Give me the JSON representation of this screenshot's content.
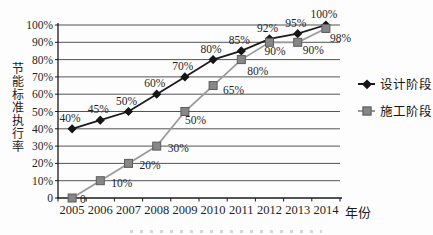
{
  "chart_data": {
    "type": "line",
    "title": "",
    "xlabel": "年份",
    "ylabel": "节能标准执行率",
    "x": [
      "2005",
      "2006",
      "2007",
      "2008",
      "2009",
      "2010",
      "2011",
      "2012",
      "2013",
      "2014"
    ],
    "ylim": [
      0,
      100
    ],
    "ytick_step": 10,
    "ytick_labels": [
      "0",
      "10%",
      "20%",
      "30%",
      "40%",
      "50%",
      "60%",
      "70%",
      "80%",
      "90%",
      "100%"
    ],
    "grid": true,
    "legend_position": "right",
    "series": [
      {
        "name": "设计阶段",
        "marker": "diamond",
        "line_color": "#1b1b1b",
        "marker_color": "#151515",
        "marker_border": "#151515",
        "values": [
          40,
          45,
          50,
          60,
          70,
          80,
          85,
          92,
          95,
          100
        ],
        "point_labels": [
          "40%",
          "45%",
          "50%",
          "60%",
          "70%",
          "80%",
          "85%",
          "92%",
          "95%",
          "100%"
        ]
      },
      {
        "name": "施工阶段",
        "marker": "square",
        "line_color": "#9b9b9b",
        "marker_color": "#878787",
        "marker_border": "#5c5c5c",
        "values": [
          0,
          10,
          20,
          30,
          50,
          65,
          80,
          90,
          90,
          98
        ],
        "point_labels": [
          "0",
          "10%",
          "20%",
          "30%",
          "50%",
          "65%",
          "80%",
          "90%",
          "90%",
          "98%"
        ]
      }
    ],
    "colors": {
      "grid": "#3f3f3f",
      "axis": "#1a1a1a",
      "label_text": "#1f1f1f",
      "background": "#fdfdfd"
    }
  }
}
